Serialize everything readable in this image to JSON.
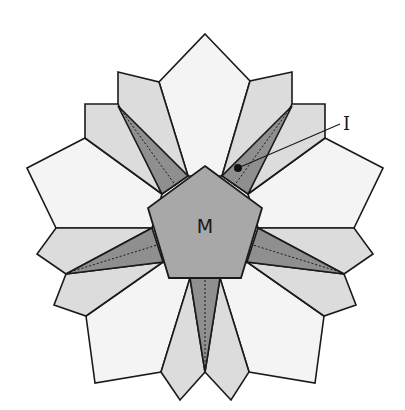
{
  "diagram": {
    "title": "",
    "labels": {
      "center": "M",
      "pointer": "I"
    },
    "colors": {
      "outer_petal": "#f4f4f4",
      "kite_petal": "#dcdcdc",
      "star_point": "#8f8f8f",
      "center_pentagon": "#a8a8a8",
      "outline": "#1a1a1a"
    },
    "parts": {
      "center_pentagon": "M",
      "outer_petals": 5,
      "kite_petals": 10,
      "star_points": 5
    }
  }
}
